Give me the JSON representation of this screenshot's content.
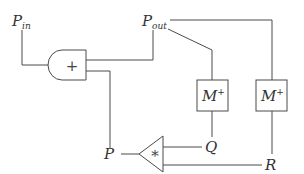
{
  "diagram": {
    "type": "signal-flow / circuit block diagram",
    "nodes": {
      "p_in": {
        "label": "P",
        "subscript": "in"
      },
      "p_out": {
        "label": "P",
        "subscript": "out"
      },
      "p": {
        "label": "P"
      },
      "q": {
        "label": "Q"
      },
      "r": {
        "label": "R"
      },
      "adder": {
        "symbol": "+",
        "shape": "and-gate"
      },
      "multiplier": {
        "symbol": "*",
        "shape": "triangle"
      },
      "m_plus_left": {
        "label": "M",
        "superscript": "+"
      },
      "m_plus_right": {
        "label": "M",
        "superscript": "+"
      }
    },
    "edges": [
      {
        "from": "P_in",
        "to": "adder"
      },
      {
        "from": "adder",
        "to": "P_out"
      },
      {
        "from": "adder",
        "to": "P"
      },
      {
        "from": "P_out",
        "to": "M+ (left)"
      },
      {
        "from": "P_out",
        "to": "M+ (right)"
      },
      {
        "from": "M+ (left)",
        "to": "Q"
      },
      {
        "from": "M+ (right)",
        "to": "R"
      },
      {
        "from": "Q",
        "to": "multiplier"
      },
      {
        "from": "R",
        "to": "multiplier"
      },
      {
        "from": "multiplier",
        "to": "P"
      }
    ],
    "colors": {
      "line": "#4a4a4a",
      "text": "#333333",
      "background": "#ffffff"
    }
  }
}
